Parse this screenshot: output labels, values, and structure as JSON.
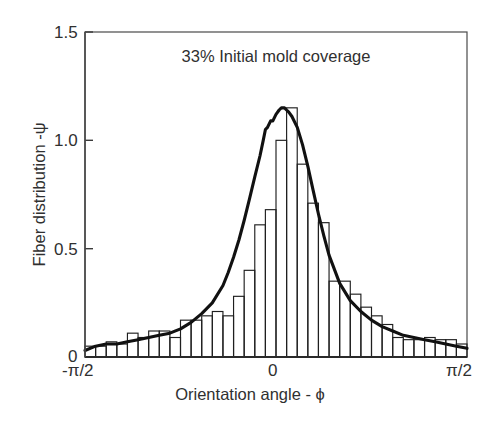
{
  "figure": {
    "annotation": "33% Initial mold coverage",
    "background_color": "#ffffff",
    "ink_color": "#1a1a1a"
  },
  "axes": {
    "y_title": "Fiber distribution -ψ",
    "x_title": "Orientation angle - ϕ",
    "y_ticks": [
      "0",
      "0.5",
      "1.0",
      "1.5"
    ],
    "x_ticks": [
      "-π/2",
      "0",
      "π/2"
    ]
  },
  "chart_data": {
    "type": "bar",
    "title": "",
    "annotation": "33% Initial mold coverage",
    "xlabel": "Orientation angle - ϕ",
    "ylabel": "Fiber distribution -ψ",
    "xlim": [
      -1.5707963,
      1.5707963
    ],
    "ylim": [
      0,
      1.5
    ],
    "xtick_values": [
      -1.5707963,
      0,
      1.5707963
    ],
    "xtick_labels": [
      "-π/2",
      "0",
      "π/2"
    ],
    "ytick_values": [
      0,
      0.5,
      1.0,
      1.5
    ],
    "ytick_labels": [
      "0",
      "0.5",
      "1.0",
      "1.5"
    ],
    "grid": false,
    "legend": null,
    "bin_count": 36,
    "bin_centers": [
      -1.527,
      -1.44,
      -1.353,
      -1.265,
      -1.178,
      -1.091,
      -1.004,
      -0.916,
      -0.829,
      -0.742,
      -0.655,
      -0.567,
      -0.48,
      -0.393,
      -0.305,
      -0.218,
      -0.131,
      -0.044,
      0.044,
      0.131,
      0.218,
      0.305,
      0.393,
      0.48,
      0.567,
      0.655,
      0.742,
      0.829,
      0.916,
      1.004,
      1.091,
      1.178,
      1.265,
      1.353,
      1.44,
      1.527
    ],
    "values": [
      0.05,
      0.05,
      0.07,
      0.06,
      0.11,
      0.09,
      0.12,
      0.12,
      0.09,
      0.17,
      0.17,
      0.19,
      0.21,
      0.19,
      0.28,
      0.4,
      0.61,
      0.68,
      1.0,
      1.15,
      0.89,
      0.71,
      0.62,
      0.35,
      0.35,
      0.29,
      0.23,
      0.19,
      0.15,
      0.09,
      0.08,
      0.08,
      0.09,
      0.08,
      0.08,
      0.06
    ],
    "series": [
      {
        "name": "histogram",
        "type": "bar",
        "values": [
          0.05,
          0.05,
          0.07,
          0.06,
          0.11,
          0.09,
          0.12,
          0.12,
          0.09,
          0.17,
          0.17,
          0.19,
          0.21,
          0.19,
          0.28,
          0.4,
          0.61,
          0.68,
          1.0,
          1.15,
          0.89,
          0.71,
          0.62,
          0.35,
          0.35,
          0.29,
          0.23,
          0.19,
          0.15,
          0.09,
          0.08,
          0.08,
          0.09,
          0.08,
          0.08,
          0.06
        ]
      },
      {
        "name": "fitted curve",
        "type": "line",
        "x": [
          -1.571,
          -1.484,
          -1.396,
          -1.309,
          -1.222,
          -1.134,
          -1.047,
          -0.96,
          -0.873,
          -0.785,
          -0.698,
          -0.611,
          -0.524,
          -0.436,
          -0.393,
          -0.349,
          -0.305,
          -0.262,
          -0.218,
          -0.175,
          -0.131,
          -0.105,
          -0.087,
          -0.07,
          -0.044,
          -0.026,
          0.0,
          0.026,
          0.044,
          0.07,
          0.087,
          0.105,
          0.131,
          0.175,
          0.218,
          0.262,
          0.305,
          0.349,
          0.393,
          0.436,
          0.524,
          0.611,
          0.698,
          0.785,
          0.873,
          0.96,
          1.047,
          1.134,
          1.222,
          1.309,
          1.396,
          1.484,
          1.571
        ],
        "y": [
          0.03,
          0.05,
          0.06,
          0.06,
          0.07,
          0.08,
          0.09,
          0.1,
          0.11,
          0.13,
          0.16,
          0.2,
          0.25,
          0.33,
          0.39,
          0.46,
          0.54,
          0.63,
          0.73,
          0.83,
          0.93,
          1.0,
          1.05,
          1.06,
          1.09,
          1.09,
          1.12,
          1.14,
          1.15,
          1.15,
          1.14,
          1.13,
          1.11,
          1.06,
          0.98,
          0.88,
          0.77,
          0.66,
          0.56,
          0.47,
          0.34,
          0.26,
          0.21,
          0.17,
          0.14,
          0.12,
          0.1,
          0.09,
          0.08,
          0.07,
          0.06,
          0.05,
          0.04
        ]
      }
    ]
  }
}
